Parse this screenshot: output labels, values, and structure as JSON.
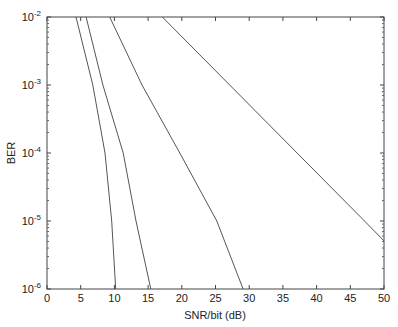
{
  "chart_data": {
    "type": "line",
    "title": "",
    "xlabel": "SNR/bit (dB)",
    "ylabel": "BER",
    "xlim": [
      0,
      50
    ],
    "ylim": [
      1e-06,
      0.01
    ],
    "yscale": "log",
    "grid": false,
    "legend": null,
    "x_ticks": [
      0,
      5,
      10,
      15,
      20,
      25,
      30,
      35,
      40,
      45,
      50
    ],
    "y_ticks": [
      {
        "exp": -2
      },
      {
        "exp": -3
      },
      {
        "exp": -4
      },
      {
        "exp": -5
      },
      {
        "exp": -6
      }
    ],
    "series": [
      {
        "name": "curve-1",
        "points": [
          [
            4.3,
            0.01
          ],
          [
            6.8,
            0.001
          ],
          [
            8.6,
            0.0001
          ],
          [
            9.6,
            1e-05
          ],
          [
            10.2,
            1e-06
          ]
        ]
      },
      {
        "name": "curve-2",
        "points": [
          [
            5.8,
            0.01
          ],
          [
            8.3,
            0.001
          ],
          [
            11.3,
            0.0001
          ],
          [
            13.2,
            1e-05
          ],
          [
            15.4,
            1e-06
          ]
        ]
      },
      {
        "name": "curve-3",
        "points": [
          [
            9.3,
            0.01
          ],
          [
            14.1,
            0.001
          ],
          [
            19.7,
            0.0001
          ],
          [
            25.2,
            1e-05
          ],
          [
            29.1,
            1e-06
          ]
        ]
      },
      {
        "name": "curve-4",
        "points": [
          [
            17.1,
            0.01
          ],
          [
            27.1,
            0.001
          ],
          [
            37.1,
            0.0001
          ],
          [
            47.1,
            1e-05
          ],
          [
            50,
            5.1e-06
          ]
        ]
      }
    ]
  },
  "colors": {
    "axis": "#444444",
    "line": "#555555",
    "background": "#ffffff"
  }
}
